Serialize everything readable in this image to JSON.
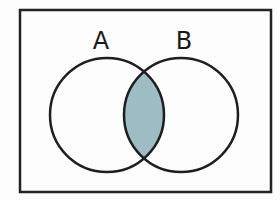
{
  "diagram": {
    "type": "venn",
    "universe": {
      "x": 20,
      "y": 10,
      "width": 251,
      "height": 182,
      "stroke": "#222222"
    },
    "sets": [
      {
        "label": "A",
        "cx": 107,
        "cy": 115,
        "r": 57,
        "label_x": 101,
        "label_y": 49
      },
      {
        "label": "B",
        "cx": 181,
        "cy": 115,
        "r": 57,
        "label_x": 184,
        "label_y": 49
      }
    ],
    "shaded_region": "A ∩ B",
    "colors": {
      "shade": "#9dbcc3",
      "stroke": "#1e1e1e",
      "background": "#fdfdfd"
    }
  }
}
